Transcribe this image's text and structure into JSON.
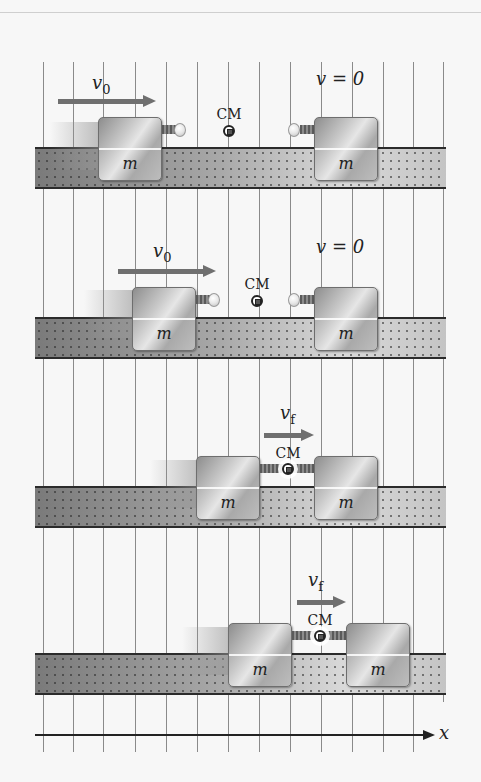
{
  "figure": {
    "type": "physics-diagram",
    "axis_label": "x",
    "grid_line_count": 14,
    "colors": {
      "background": "#f7f7f7",
      "track": "#9d9d9d",
      "block": "#bdbdbd",
      "arrow": "#6f6f6f",
      "ink": "#222222"
    }
  },
  "panels": [
    {
      "id": 1,
      "left_block": {
        "label": "m",
        "velocity_label": "v",
        "velocity_sub": "0"
      },
      "right_block": {
        "label": "m",
        "velocity_text": "v = 0"
      },
      "cm_label": "CM",
      "state": "approaching"
    },
    {
      "id": 2,
      "left_block": {
        "label": "m",
        "velocity_label": "v",
        "velocity_sub": "0"
      },
      "right_block": {
        "label": "m",
        "velocity_text": "v = 0"
      },
      "cm_label": "CM",
      "state": "approaching"
    },
    {
      "id": 3,
      "left_block": {
        "label": "m"
      },
      "right_block": {
        "label": "m"
      },
      "combined_velocity_label": "v",
      "combined_velocity_sub": "f",
      "cm_label": "CM",
      "state": "coupled"
    },
    {
      "id": 4,
      "left_block": {
        "label": "m"
      },
      "right_block": {
        "label": "m"
      },
      "combined_velocity_label": "v",
      "combined_velocity_sub": "f",
      "cm_label": "CM",
      "state": "coupled"
    }
  ]
}
